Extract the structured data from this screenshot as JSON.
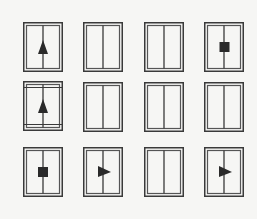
{
  "puzzle": {
    "title": "",
    "rows": 3,
    "cols": 4,
    "colors": {
      "background": "#f6f6f4",
      "stroke": "#3a3a3a",
      "inner_stroke": "#5a5a5a",
      "fill": "#2a2a2a"
    },
    "cells": [
      {
        "row": 0,
        "col": 0,
        "symbol": "up-arrow",
        "rails": false
      },
      {
        "row": 0,
        "col": 1,
        "symbol": "none",
        "rails": false
      },
      {
        "row": 0,
        "col": 2,
        "symbol": "none",
        "rails": false
      },
      {
        "row": 0,
        "col": 3,
        "symbol": "square",
        "rails": false
      },
      {
        "row": 1,
        "col": 0,
        "symbol": "up-arrow",
        "rails": true
      },
      {
        "row": 1,
        "col": 1,
        "symbol": "none",
        "rails": false
      },
      {
        "row": 1,
        "col": 2,
        "symbol": "none",
        "rails": false
      },
      {
        "row": 1,
        "col": 3,
        "symbol": "none",
        "rails": false
      },
      {
        "row": 2,
        "col": 0,
        "symbol": "square",
        "rails": false
      },
      {
        "row": 2,
        "col": 1,
        "symbol": "right-triangle",
        "rails": false
      },
      {
        "row": 2,
        "col": 2,
        "symbol": "none",
        "rails": false
      },
      {
        "row": 2,
        "col": 3,
        "symbol": "right-triangle",
        "rails": false
      }
    ]
  }
}
